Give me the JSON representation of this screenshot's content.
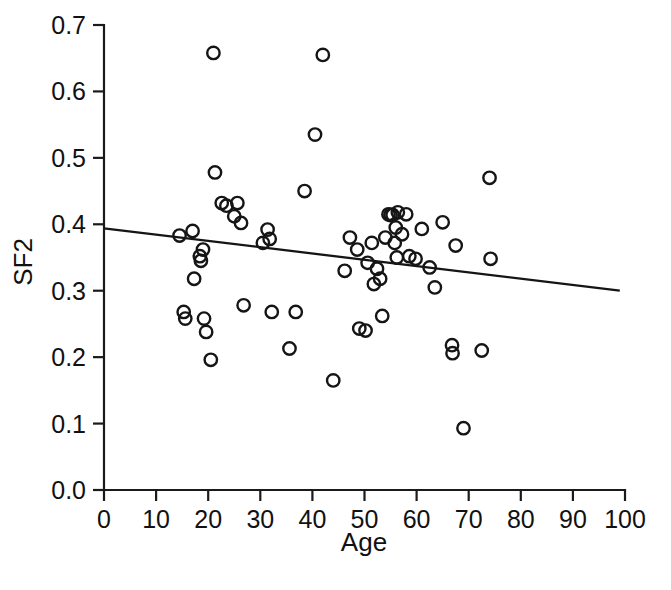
{
  "chart_data": {
    "type": "scatter",
    "title": "",
    "xlabel": "Age",
    "ylabel": "SF2",
    "xlim": [
      0,
      100
    ],
    "ylim": [
      0.0,
      0.7
    ],
    "grid": false,
    "legend": null,
    "xticks": [
      "0",
      "10",
      "20",
      "30",
      "40",
      "50",
      "60",
      "70",
      "80",
      "90",
      "100"
    ],
    "xtick_values": [
      0,
      10,
      20,
      30,
      40,
      50,
      60,
      70,
      80,
      90,
      100
    ],
    "yticks": [
      "0.0",
      "0.1",
      "0.2",
      "0.3",
      "0.4",
      "0.5",
      "0.6",
      "0.7"
    ],
    "ytick_values": [
      0.0,
      0.1,
      0.2,
      0.3,
      0.4,
      0.5,
      0.6,
      0.7
    ],
    "marker": "open-circle",
    "marker_color": "#151515",
    "points": [
      {
        "x": 14.5,
        "y": 0.383
      },
      {
        "x": 15.3,
        "y": 0.268
      },
      {
        "x": 15.6,
        "y": 0.258
      },
      {
        "x": 17.0,
        "y": 0.39
      },
      {
        "x": 17.3,
        "y": 0.318
      },
      {
        "x": 18.4,
        "y": 0.352
      },
      {
        "x": 18.6,
        "y": 0.345
      },
      {
        "x": 19.0,
        "y": 0.362
      },
      {
        "x": 19.2,
        "y": 0.258
      },
      {
        "x": 19.6,
        "y": 0.238
      },
      {
        "x": 20.5,
        "y": 0.196
      },
      {
        "x": 21.0,
        "y": 0.658
      },
      {
        "x": 21.3,
        "y": 0.478
      },
      {
        "x": 22.6,
        "y": 0.432
      },
      {
        "x": 23.5,
        "y": 0.428
      },
      {
        "x": 25.0,
        "y": 0.412
      },
      {
        "x": 25.6,
        "y": 0.432
      },
      {
        "x": 26.3,
        "y": 0.402
      },
      {
        "x": 26.8,
        "y": 0.278
      },
      {
        "x": 30.5,
        "y": 0.372
      },
      {
        "x": 31.4,
        "y": 0.392
      },
      {
        "x": 31.8,
        "y": 0.378
      },
      {
        "x": 32.2,
        "y": 0.268
      },
      {
        "x": 35.6,
        "y": 0.213
      },
      {
        "x": 36.8,
        "y": 0.268
      },
      {
        "x": 38.5,
        "y": 0.45
      },
      {
        "x": 40.5,
        "y": 0.535
      },
      {
        "x": 42.0,
        "y": 0.655
      },
      {
        "x": 44.0,
        "y": 0.165
      },
      {
        "x": 46.2,
        "y": 0.33
      },
      {
        "x": 47.2,
        "y": 0.38
      },
      {
        "x": 48.6,
        "y": 0.362
      },
      {
        "x": 49.0,
        "y": 0.243
      },
      {
        "x": 50.2,
        "y": 0.24
      },
      {
        "x": 50.6,
        "y": 0.342
      },
      {
        "x": 51.4,
        "y": 0.372
      },
      {
        "x": 51.8,
        "y": 0.31
      },
      {
        "x": 52.4,
        "y": 0.333
      },
      {
        "x": 53.0,
        "y": 0.318
      },
      {
        "x": 53.4,
        "y": 0.262
      },
      {
        "x": 54.0,
        "y": 0.38
      },
      {
        "x": 54.6,
        "y": 0.415
      },
      {
        "x": 55.0,
        "y": 0.414
      },
      {
        "x": 55.4,
        "y": 0.414
      },
      {
        "x": 55.8,
        "y": 0.372
      },
      {
        "x": 56.0,
        "y": 0.395
      },
      {
        "x": 56.2,
        "y": 0.35
      },
      {
        "x": 56.4,
        "y": 0.418
      },
      {
        "x": 57.2,
        "y": 0.385
      },
      {
        "x": 58.0,
        "y": 0.415
      },
      {
        "x": 58.6,
        "y": 0.352
      },
      {
        "x": 59.8,
        "y": 0.348
      },
      {
        "x": 61.0,
        "y": 0.393
      },
      {
        "x": 62.5,
        "y": 0.335
      },
      {
        "x": 63.5,
        "y": 0.305
      },
      {
        "x": 65.0,
        "y": 0.403
      },
      {
        "x": 66.8,
        "y": 0.218
      },
      {
        "x": 66.9,
        "y": 0.206
      },
      {
        "x": 67.5,
        "y": 0.368
      },
      {
        "x": 69.0,
        "y": 0.093
      },
      {
        "x": 72.5,
        "y": 0.21
      },
      {
        "x": 74.0,
        "y": 0.47
      },
      {
        "x": 74.2,
        "y": 0.348
      }
    ],
    "trend": {
      "name": "regression-line",
      "x_start": 0,
      "y_start": 0.394,
      "x_end": 99,
      "y_end": 0.3
    }
  }
}
